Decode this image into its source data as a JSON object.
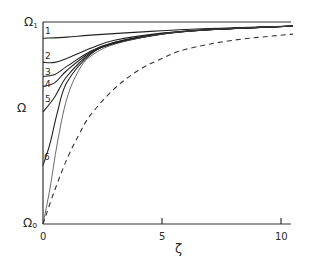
{
  "chart_data": {
    "type": "line",
    "title": "",
    "xlabel": "ζ",
    "ylabel": "Ω",
    "xlim": [
      0,
      10.5
    ],
    "ylim": [
      0,
      1
    ],
    "grid": false,
    "legend": "none (curves labelled inline 1–6)",
    "x_ticks": [
      {
        "value": 0,
        "label": "0"
      },
      {
        "value": 5,
        "label": "5"
      },
      {
        "value": 10,
        "label": "10"
      }
    ],
    "y_ticks": [
      {
        "value": 0,
        "label": "Ω₀"
      },
      {
        "value": 1,
        "label": "Ω₁"
      }
    ],
    "series": [
      {
        "name": "1",
        "style": "solid",
        "x": [
          0,
          1,
          2,
          4,
          6,
          8,
          10.5
        ],
        "y": [
          0.92,
          0.925,
          0.935,
          0.95,
          0.963,
          0.972,
          0.98
        ]
      },
      {
        "name": "2",
        "style": "solid",
        "x": [
          0,
          0.5,
          1,
          2,
          3,
          5,
          7,
          10.5
        ],
        "y": [
          0.8,
          0.8,
          0.82,
          0.87,
          0.91,
          0.945,
          0.963,
          0.98
        ]
      },
      {
        "name": "3",
        "style": "solid",
        "x": [
          0,
          0.5,
          1,
          2,
          3,
          5,
          7,
          10.5
        ],
        "y": [
          0.73,
          0.74,
          0.78,
          0.855,
          0.9,
          0.943,
          0.962,
          0.98
        ]
      },
      {
        "name": "4",
        "style": "solid",
        "x": [
          0,
          0.5,
          1,
          2,
          3,
          5,
          7,
          10.5
        ],
        "y": [
          0.68,
          0.7,
          0.76,
          0.85,
          0.898,
          0.942,
          0.962,
          0.98
        ]
      },
      {
        "name": "5",
        "style": "solid",
        "x": [
          0,
          0.5,
          1,
          2,
          3,
          5,
          7,
          10.5
        ],
        "y": [
          0.555,
          0.63,
          0.73,
          0.845,
          0.895,
          0.941,
          0.962,
          0.98
        ]
      },
      {
        "name": "6",
        "style": "solid",
        "x": [
          0,
          0.3,
          0.6,
          1,
          2,
          3,
          5,
          7,
          10.5
        ],
        "y": [
          0.29,
          0.4,
          0.55,
          0.7,
          0.84,
          0.893,
          0.94,
          0.962,
          0.98
        ]
      },
      {
        "name": "limit (thin)",
        "style": "thin-solid",
        "x": [
          0,
          0.3,
          0.6,
          1,
          1.5,
          2,
          3,
          5,
          7,
          10.5
        ],
        "y": [
          0.0,
          0.18,
          0.4,
          0.62,
          0.76,
          0.83,
          0.89,
          0.94,
          0.962,
          0.98
        ]
      },
      {
        "name": "reference (dashed)",
        "style": "dashed",
        "x": [
          0,
          0.5,
          1,
          1.5,
          2,
          3,
          4,
          5,
          6,
          8,
          10.5
        ],
        "y": [
          0.0,
          0.17,
          0.32,
          0.44,
          0.54,
          0.67,
          0.76,
          0.82,
          0.865,
          0.91,
          0.94
        ]
      }
    ],
    "annotations": [
      {
        "text": "1",
        "x": 0.15,
        "y": 0.945
      },
      {
        "text": "2",
        "x": 0.15,
        "y": 0.83
      },
      {
        "text": "3",
        "x": 0.15,
        "y": 0.75
      },
      {
        "text": "4",
        "x": 0.15,
        "y": 0.7
      },
      {
        "text": "5",
        "x": 0.15,
        "y": 0.62
      },
      {
        "text": "6",
        "x": 0.15,
        "y": 0.33
      }
    ]
  },
  "labels": {
    "y_top": "Ω",
    "y_top_sub": "1",
    "y_mid": "Ω",
    "y_bottom": "Ω",
    "y_bottom_sub": "o",
    "x_axis": "ζ",
    "tick_0": "0",
    "tick_5": "5",
    "tick_10": "10",
    "curve_1": "1",
    "curve_2": "2",
    "curve_3": "3",
    "curve_4": "4",
    "curve_5": "5",
    "curve_6": "6"
  }
}
